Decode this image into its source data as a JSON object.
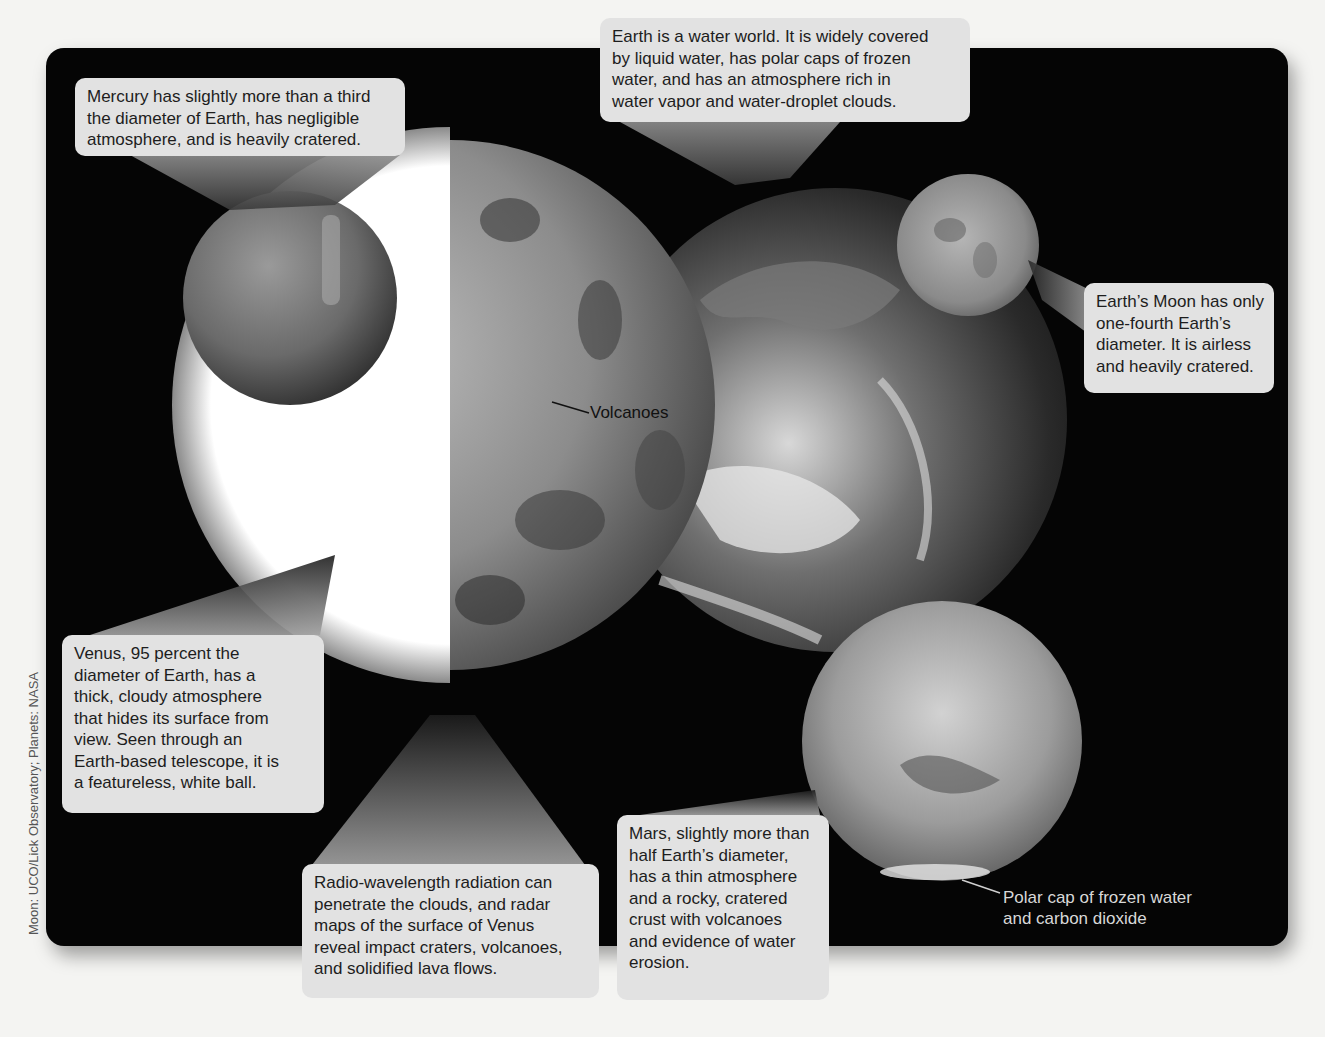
{
  "figure": {
    "credit": "Moon: UCO/Lick Observatory; Planets: NASA",
    "colors": {
      "panel_background": "#050505",
      "page_background": "#f4f4f2",
      "callout_fill": "#e2e2e2",
      "callout_text": "#1d1d1d",
      "venus_telescopic_white": "#ffffff"
    },
    "bodies": [
      "Mercury",
      "Venus",
      "Earth",
      "Moon",
      "Mars"
    ]
  },
  "callouts": {
    "mercury": {
      "lines": [
        "Mercury has slightly more than a third",
        "the diameter of Earth, has negligible",
        "atmosphere, and is heavily cratered."
      ]
    },
    "earth": {
      "lines": [
        "Earth is a water world. It is widely covered",
        "by liquid water, has polar caps of frozen",
        "water, and has an atmosphere rich in",
        "water vapor and water-droplet clouds."
      ]
    },
    "moon": {
      "lines": [
        "Earth’s Moon has only",
        "one-fourth Earth’s",
        "diameter. It is airless",
        "and heavily cratered."
      ]
    },
    "venus": {
      "lines": [
        "Venus, 95 percent the",
        "diameter of Earth, has a",
        "thick, cloudy atmosphere",
        "that hides its surface from",
        "view. Seen through an",
        "Earth-based telescope, it is",
        "a featureless, white ball."
      ]
    },
    "venus_radar": {
      "lines": [
        "Radio-wavelength radiation can",
        "penetrate the clouds, and radar",
        "maps of the surface of Venus",
        "reveal impact craters, volcanoes,",
        "and solidified lava flows."
      ]
    },
    "mars": {
      "lines": [
        "Mars, slightly more than",
        "half Earth’s diameter,",
        "has a thin atmosphere",
        "and a rocky, cratered",
        "crust with volcanoes",
        "and evidence of water",
        "erosion."
      ]
    }
  },
  "labels": {
    "volcanoes": "Volcanoes",
    "polar_cap": {
      "lines": [
        "Polar cap of frozen water",
        "and carbon dioxide"
      ]
    }
  }
}
